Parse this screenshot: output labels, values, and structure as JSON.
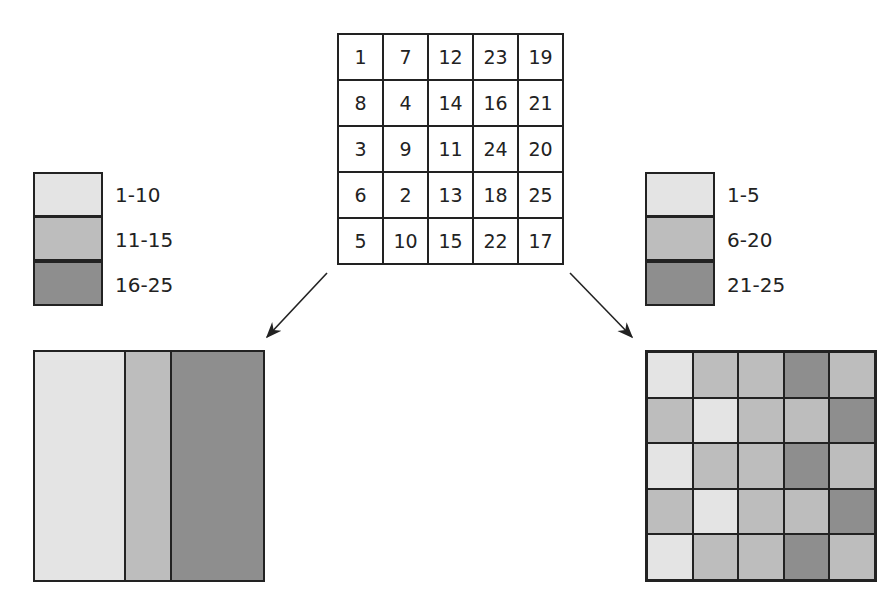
{
  "colors": {
    "light": "#e4e4e4",
    "medium": "#bdbdbd",
    "dark": "#8e8e8e"
  },
  "grid": {
    "rows": [
      [
        "1",
        "7",
        "12",
        "23",
        "19"
      ],
      [
        "8",
        "4",
        "14",
        "16",
        "21"
      ],
      [
        "3",
        "9",
        "11",
        "24",
        "20"
      ],
      [
        "6",
        "2",
        "13",
        "18",
        "25"
      ],
      [
        "5",
        "10",
        "15",
        "22",
        "17"
      ]
    ]
  },
  "legend_left": {
    "items": [
      {
        "label": "1-10",
        "shade": "light"
      },
      {
        "label": "11-15",
        "shade": "medium"
      },
      {
        "label": "16-25",
        "shade": "dark"
      }
    ]
  },
  "legend_right": {
    "items": [
      {
        "label": "1-5",
        "shade": "light"
      },
      {
        "label": "6-20",
        "shade": "medium"
      },
      {
        "label": "21-25",
        "shade": "dark"
      }
    ]
  },
  "map_left": {
    "strips": [
      {
        "shade": "light",
        "width_pct": 40
      },
      {
        "shade": "medium",
        "width_pct": 20
      },
      {
        "shade": "dark",
        "width_pct": 40
      }
    ]
  },
  "map_right": {
    "cells": [
      [
        "light",
        "medium",
        "medium",
        "dark",
        "medium"
      ],
      [
        "medium",
        "light",
        "medium",
        "medium",
        "dark"
      ],
      [
        "light",
        "medium",
        "medium",
        "dark",
        "medium"
      ],
      [
        "medium",
        "light",
        "medium",
        "medium",
        "dark"
      ],
      [
        "light",
        "medium",
        "medium",
        "dark",
        "medium"
      ]
    ]
  }
}
